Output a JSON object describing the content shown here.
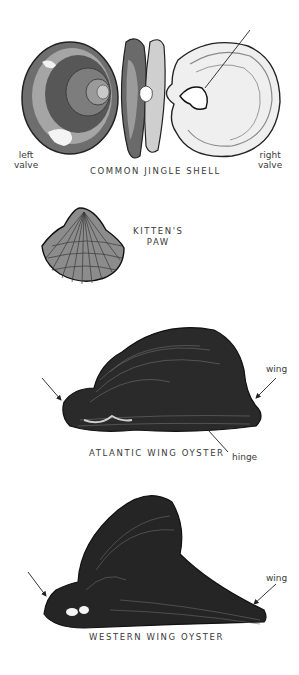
{
  "plate": {
    "figures": [
      {
        "id": "common-jingle-shell",
        "caption": "COMMON JINGLE SHELL",
        "labels": {
          "left": [
            "left",
            "valve"
          ],
          "right": [
            "right",
            "valve"
          ]
        }
      },
      {
        "id": "kittens-paw",
        "caption": [
          "KITTEN'S",
          "PAW"
        ]
      },
      {
        "id": "atlantic-wing-oyster",
        "caption": "ATLANTIC WING OYSTER",
        "labels": {
          "wing": "wing",
          "hinge": "hinge"
        }
      },
      {
        "id": "western-wing-oyster",
        "caption": "WESTERN WING OYSTER",
        "labels": {
          "wing": "wing"
        }
      }
    ]
  },
  "colors": {
    "background": "#ffffff",
    "ink": "#1e1e1e",
    "shell_dark": "#2b2b2b",
    "shell_mid": "#7a7a7a",
    "shell_light": "#c8c8c8",
    "text": "#3a3a3a"
  }
}
